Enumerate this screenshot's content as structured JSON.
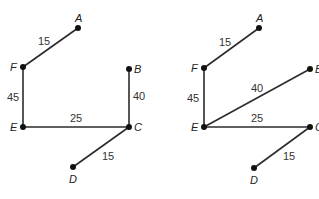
{
  "diagrams": [
    {
      "name": "left-graph",
      "nodes": {
        "A": {
          "label": "A",
          "x": 78,
          "y": 28,
          "lx": 75,
          "ly": 22
        },
        "F": {
          "label": "F",
          "x": 23,
          "y": 67,
          "lx": 10,
          "ly": 71
        },
        "B": {
          "label": "B",
          "x": 129,
          "y": 69,
          "lx": 134,
          "ly": 73
        },
        "E": {
          "label": "E",
          "x": 23,
          "y": 127,
          "lx": 10,
          "ly": 131
        },
        "C": {
          "label": "C",
          "x": 129,
          "y": 127,
          "lx": 134,
          "ly": 131
        },
        "D": {
          "label": "D",
          "x": 73,
          "y": 167,
          "lx": 69,
          "ly": 183
        }
      },
      "edges": [
        {
          "from": "F",
          "to": "A",
          "weight": "15",
          "lx": 38,
          "ly": 45
        },
        {
          "from": "F",
          "to": "E",
          "weight": "45",
          "lx": 7,
          "ly": 101
        },
        {
          "from": "B",
          "to": "C",
          "weight": "40",
          "lx": 133,
          "ly": 100
        },
        {
          "from": "E",
          "to": "C",
          "weight": "25",
          "lx": 70,
          "ly": 122
        },
        {
          "from": "C",
          "to": "D",
          "weight": "15",
          "lx": 102,
          "ly": 160
        }
      ]
    },
    {
      "name": "right-graph",
      "nodes": {
        "A": {
          "label": "A",
          "x": 259,
          "y": 28,
          "lx": 256,
          "ly": 22
        },
        "F": {
          "label": "F",
          "x": 204,
          "y": 68,
          "lx": 191,
          "ly": 72
        },
        "B": {
          "label": "B",
          "x": 310,
          "y": 69,
          "lx": 315,
          "ly": 73
        },
        "E": {
          "label": "E",
          "x": 204,
          "y": 127,
          "lx": 191,
          "ly": 131
        },
        "C": {
          "label": "C",
          "x": 310,
          "y": 127,
          "lx": 315,
          "ly": 131
        },
        "D": {
          "label": "D",
          "x": 254,
          "y": 168,
          "lx": 250,
          "ly": 184
        }
      },
      "edges": [
        {
          "from": "F",
          "to": "A",
          "weight": "15",
          "lx": 219,
          "ly": 46
        },
        {
          "from": "F",
          "to": "E",
          "weight": "45",
          "lx": 187,
          "ly": 102
        },
        {
          "from": "E",
          "to": "B",
          "weight": "40",
          "lx": 251,
          "ly": 92
        },
        {
          "from": "E",
          "to": "C",
          "weight": "25",
          "lx": 251,
          "ly": 122
        },
        {
          "from": "C",
          "to": "D",
          "weight": "15",
          "lx": 283,
          "ly": 160
        }
      ]
    }
  ]
}
